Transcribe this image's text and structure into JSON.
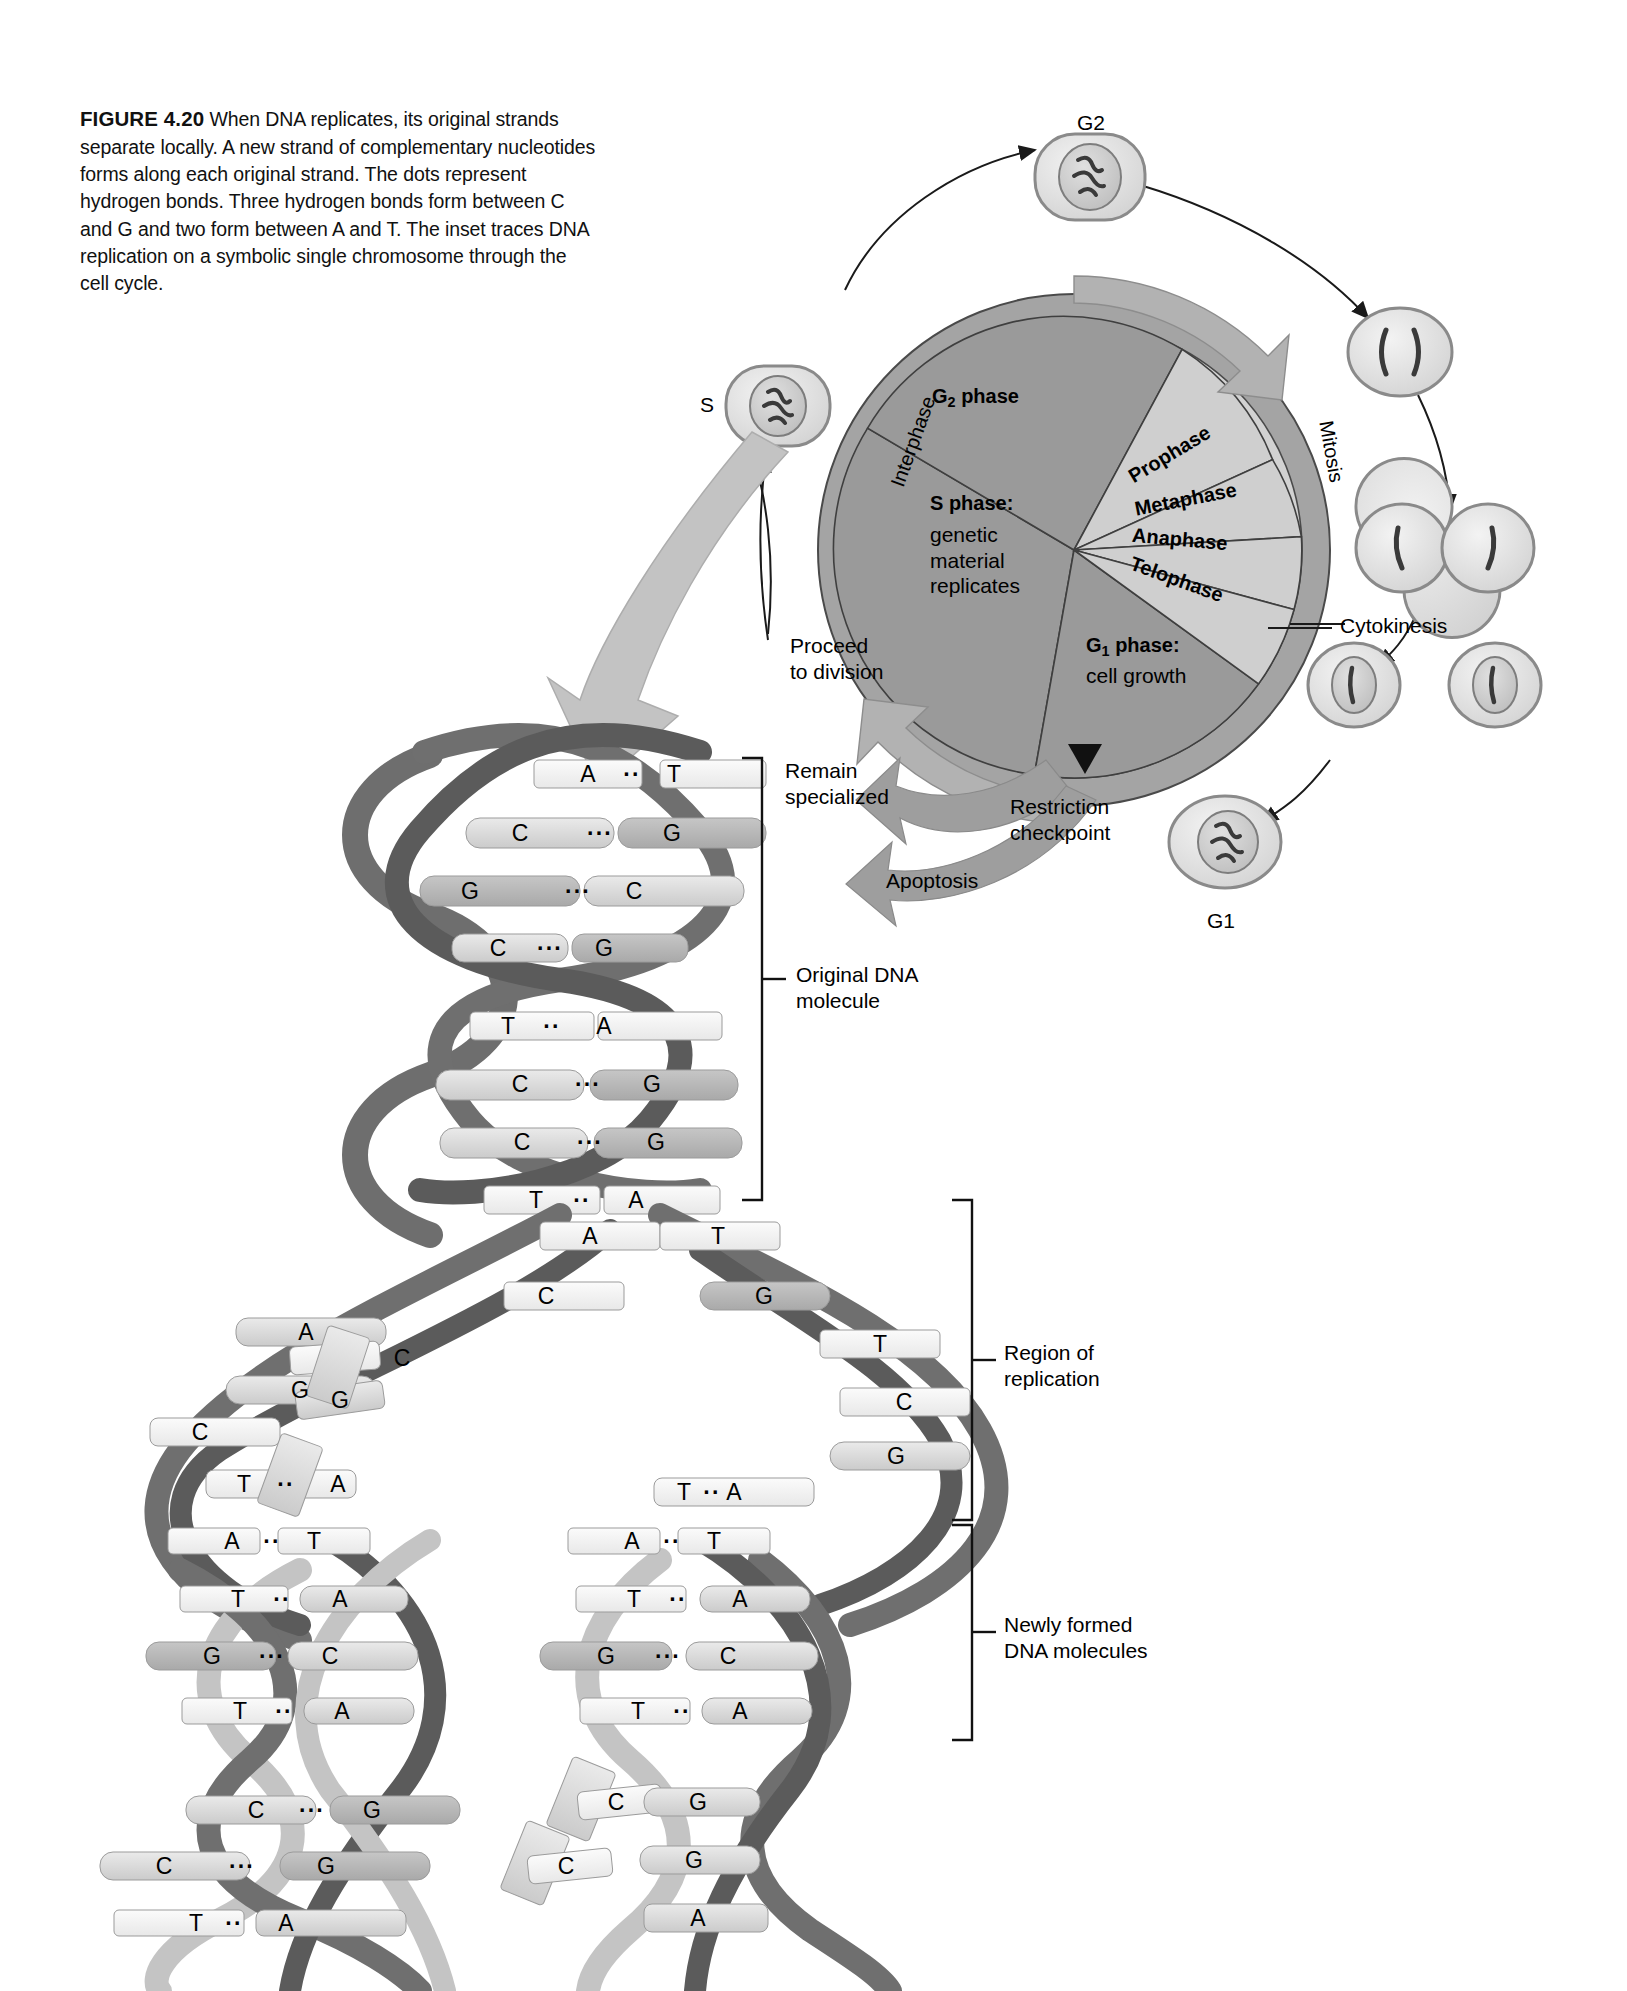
{
  "figure": {
    "label": "FIGURE 4.20",
    "caption": "When DNA replicates, its original strands separate locally. A new strand of complementary nucleotides forms along each original strand. The dots represent hydrogen bonds. Three hydrogen bonds form between C and G and two form between A and T. The inset traces DNA replication on a symbolic single chromosome through the cell cycle."
  },
  "cell_cycle": {
    "title": "cell-cycle-wheel",
    "sectors": [
      {
        "id": "s-phase",
        "label": "S phase:",
        "sublabel": "genetic\nmaterial\nreplicates"
      },
      {
        "id": "g2-phase",
        "label": "G2 phase",
        "sublabel": ""
      },
      {
        "id": "prophase",
        "label": "Prophase",
        "sublabel": ""
      },
      {
        "id": "metaphase",
        "label": "Metaphase",
        "sublabel": ""
      },
      {
        "id": "anaphase",
        "label": "Anaphase",
        "sublabel": ""
      },
      {
        "id": "telophase",
        "label": "Telophase",
        "sublabel": ""
      },
      {
        "id": "g1-phase",
        "label": "G1 phase:",
        "sublabel": "cell growth"
      }
    ],
    "ring_labels": {
      "interphase": "Interphase",
      "mitosis": "Mitosis"
    },
    "annotations": {
      "proceed": "Proceed\nto division",
      "remain": "Remain\nspecialized",
      "apoptosis": "Apoptosis",
      "restriction": "Restriction\ncheckpoint",
      "cytokinesis": "Cytokinesis"
    },
    "stage_cells": {
      "g2": "G2",
      "s": "S",
      "g1": "G1"
    },
    "colors": {
      "interphase_fill": "#9a9a9a",
      "mitosis_fill": "#cfcfcf",
      "ring_fill": "#a8a8a8",
      "arrow_fill": "#b4b4b4",
      "outline": "#3a3a3a"
    }
  },
  "dna": {
    "brackets": [
      {
        "id": "original",
        "label": "Original DNA\nmolecule"
      },
      {
        "id": "replication",
        "label": "Region of\nreplication"
      },
      {
        "id": "newly",
        "label": "Newly formed\nDNA molecules"
      }
    ],
    "colors": {
      "backbone_dark": "#6e6e6e",
      "backbone_darker": "#585858",
      "backbone_light": "#c9c9c9",
      "nucleotide_light": "#d9d9d9",
      "nucleotide_mid": "#b9b9b9",
      "nucleotide_pale": "#efefef"
    },
    "original_pairs": [
      {
        "left": "A",
        "bond": "··",
        "right": "T"
      },
      {
        "left": "C",
        "bond": "···",
        "right": "G"
      },
      {
        "left": "G",
        "bond": "···",
        "right": "C"
      },
      {
        "left": "C",
        "bond": "···",
        "right": "G"
      },
      {
        "left": "T",
        "bond": "··",
        "right": "A"
      },
      {
        "left": "C",
        "bond": "···",
        "right": "G"
      },
      {
        "left": "C",
        "bond": "···",
        "right": "G"
      },
      {
        "left": "T",
        "bond": "··",
        "right": "A"
      }
    ],
    "replication_left_bases": [
      "A",
      "C",
      "A",
      "G",
      "C",
      "T"
    ],
    "replication_left_free": [
      "C",
      "G"
    ],
    "replication_right_bases": [
      "T",
      "G",
      "T",
      "C",
      "G",
      "A"
    ],
    "replication_fork_pair": {
      "left": "T",
      "bond": "··",
      "right": "A"
    },
    "new_left_pairs": [
      {
        "left": "A",
        "bond": "··",
        "right": "T"
      },
      {
        "left": "T",
        "bond": "··",
        "right": "A"
      },
      {
        "left": "G",
        "bond": "···",
        "right": "C"
      },
      {
        "left": "T",
        "bond": "··",
        "right": "A"
      },
      {
        "left": "C",
        "bond": "···",
        "right": "G"
      },
      {
        "left": "C",
        "bond": "···",
        "right": "G"
      },
      {
        "left": "T",
        "bond": "··",
        "right": "A"
      }
    ],
    "new_right_pairs": [
      {
        "left": "A",
        "bond": "··",
        "right": "T"
      },
      {
        "left": "T",
        "bond": "··",
        "right": "A"
      },
      {
        "left": "G",
        "bond": "···",
        "right": "C"
      },
      {
        "left": "T",
        "bond": "··",
        "right": "A"
      }
    ],
    "new_right_free": [
      "C",
      "C"
    ],
    "new_right_tail": [
      "G",
      "G",
      "A"
    ]
  }
}
